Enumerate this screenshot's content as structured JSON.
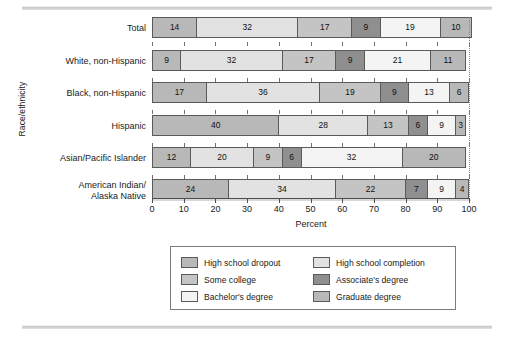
{
  "chart_data": {
    "type": "bar",
    "orientation": "horizontal",
    "stacked": true,
    "title": "",
    "xlabel": "Percent",
    "ylabel": "Race/ethnicity",
    "xlim": [
      0,
      100
    ],
    "xticks": [
      0,
      10,
      20,
      30,
      40,
      50,
      60,
      70,
      80,
      90,
      100
    ],
    "xticklabels": [
      "0",
      "10",
      "20",
      "30",
      "40",
      "50",
      "60",
      "70",
      "80",
      "90",
      "100"
    ],
    "grid": false,
    "legend_position": "bottom",
    "categories": [
      "Total",
      "White, non-Hispanic",
      "Black, non-Hispanic",
      "Hispanic",
      "Asian/Pacific Islander",
      "American Indian/\nAlaska Native"
    ],
    "series": [
      {
        "name": "High school dropout",
        "color": "#b8b8b8",
        "values": [
          14,
          9,
          17,
          40,
          12,
          24
        ]
      },
      {
        "name": "High school completion",
        "color": "#e2e2e2",
        "values": [
          32,
          32,
          36,
          28,
          20,
          34
        ]
      },
      {
        "name": "Some college",
        "color": "#c4c4c4",
        "values": [
          17,
          17,
          19,
          13,
          9,
          22
        ]
      },
      {
        "name": "Associate's degree",
        "color": "#8f8f8f",
        "values": [
          9,
          9,
          9,
          6,
          6,
          7
        ]
      },
      {
        "name": "Bachelor's degree",
        "color": "#f4f4f4",
        "values": [
          19,
          21,
          13,
          9,
          32,
          9
        ]
      },
      {
        "name": "Graduate degree",
        "color": "#b8b8b8",
        "values": [
          10,
          11,
          6,
          3,
          20,
          4
        ]
      }
    ]
  },
  "legend": {
    "items": [
      {
        "label": "High school dropout",
        "swatch": "#b8b8b8"
      },
      {
        "label": "High school completion",
        "swatch": "#e2e2e2"
      },
      {
        "label": "Some college",
        "swatch": "#c4c4c4"
      },
      {
        "label": "Associate's degree",
        "swatch": "#8f8f8f"
      },
      {
        "label": "Bachelor's degree",
        "swatch": "#f4f4f4"
      },
      {
        "label": "Graduate degree",
        "swatch": "#b8b8b8"
      }
    ]
  }
}
